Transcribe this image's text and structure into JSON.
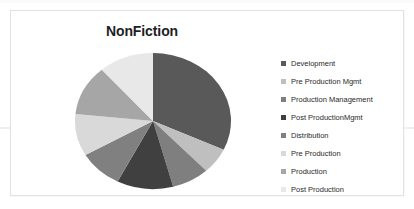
{
  "chart_data": {
    "type": "pie",
    "title": "NonFiction",
    "xlabel": "",
    "ylabel": "",
    "legend_position": "right",
    "grid": false,
    "categories": [
      "Development",
      "Pre Production Mgmt",
      "Production Management",
      "Post ProductionMgmt",
      "Distribution",
      "Pre Production",
      "Production",
      "Post Production"
    ],
    "values": [
      32,
      6,
      8,
      12,
      9,
      10,
      12,
      11
    ],
    "slice_angles_deg": [
      115,
      22,
      28,
      42,
      33,
      36,
      43,
      41
    ],
    "colors": [
      "#595959",
      "#bfbfbf",
      "#7f7f7f",
      "#404040",
      "#808080",
      "#d9d9d9",
      "#a6a6a6",
      "#e8e8e8"
    ],
    "annotations": []
  },
  "chart": {
    "title": "NonFiction"
  },
  "legend": {
    "items": [
      {
        "label": "Development",
        "color": "#595959"
      },
      {
        "label": "Pre Production Mgmt",
        "color": "#bfbfbf"
      },
      {
        "label": "Production Management",
        "color": "#7f7f7f"
      },
      {
        "label": "Post ProductionMgmt",
        "color": "#404040"
      },
      {
        "label": "Distribution",
        "color": "#808080"
      },
      {
        "label": "Pre Production",
        "color": "#d9d9d9"
      },
      {
        "label": "Production",
        "color": "#a6a6a6"
      },
      {
        "label": "Post Production",
        "color": "#e8e8e8"
      }
    ]
  }
}
